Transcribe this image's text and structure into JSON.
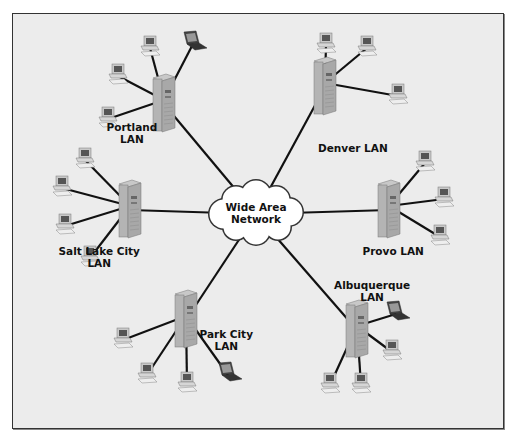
{
  "diagram": {
    "hub": {
      "line1": "Wide Area",
      "line2": "Network",
      "x": 256,
      "y": 214
    },
    "colors": {
      "background": "#ececec",
      "frame": "#333333",
      "link": "#111111",
      "server": "#a8a8a8",
      "cloud": "#ffffff"
    },
    "lans": [
      {
        "id": "portland",
        "line1": "Portland",
        "line2": "LAN",
        "server": {
          "x": 162,
          "y": 104
        },
        "label": {
          "x": 132,
          "y": 127
        },
        "devices": [
          {
            "type": "pc",
            "x": 118,
            "y": 76
          },
          {
            "type": "pc",
            "x": 150,
            "y": 48
          },
          {
            "type": "laptop",
            "x": 193,
            "y": 44
          },
          {
            "type": "pc",
            "x": 108,
            "y": 119
          }
        ]
      },
      {
        "id": "denver",
        "line1": "Denver LAN",
        "line2": "",
        "server": {
          "x": 323,
          "y": 87
        },
        "label": {
          "x": 353,
          "y": 148
        },
        "devices": [
          {
            "type": "pc",
            "x": 326,
            "y": 45
          },
          {
            "type": "pc",
            "x": 367,
            "y": 48
          },
          {
            "type": "pc",
            "x": 398,
            "y": 96
          }
        ]
      },
      {
        "id": "salt-lake-city",
        "line1": "Salt Lake City",
        "line2": "LAN",
        "server": {
          "x": 128,
          "y": 210
        },
        "label": {
          "x": 99,
          "y": 251
        },
        "devices": [
          {
            "type": "pc",
            "x": 85,
            "y": 160
          },
          {
            "type": "pc",
            "x": 62,
            "y": 188
          },
          {
            "type": "pc",
            "x": 65,
            "y": 226
          },
          {
            "type": "pc",
            "x": 90,
            "y": 258
          }
        ]
      },
      {
        "id": "provo",
        "line1": "Provo LAN",
        "line2": "",
        "server": {
          "x": 387,
          "y": 210
        },
        "label": {
          "x": 393,
          "y": 251
        },
        "devices": [
          {
            "type": "pc",
            "x": 425,
            "y": 163
          },
          {
            "type": "pc",
            "x": 444,
            "y": 199
          },
          {
            "type": "pc",
            "x": 440,
            "y": 237
          }
        ]
      },
      {
        "id": "park-city",
        "line1": "Park City",
        "line2": "LAN",
        "server": {
          "x": 184,
          "y": 320
        },
        "label": {
          "x": 226,
          "y": 334
        },
        "devices": [
          {
            "type": "pc",
            "x": 123,
            "y": 340
          },
          {
            "type": "pc",
            "x": 147,
            "y": 375
          },
          {
            "type": "pc",
            "x": 187,
            "y": 384
          },
          {
            "type": "laptop",
            "x": 228,
            "y": 375
          }
        ]
      },
      {
        "id": "albuquerque",
        "line1": "Albuquerque",
        "line2": "LAN",
        "server": {
          "x": 355,
          "y": 330
        },
        "label": {
          "x": 372,
          "y": 285
        },
        "devices": [
          {
            "type": "laptop",
            "x": 396,
            "y": 314
          },
          {
            "type": "pc",
            "x": 392,
            "y": 352
          },
          {
            "type": "pc",
            "x": 330,
            "y": 385
          },
          {
            "type": "pc",
            "x": 361,
            "y": 385
          }
        ]
      }
    ]
  }
}
